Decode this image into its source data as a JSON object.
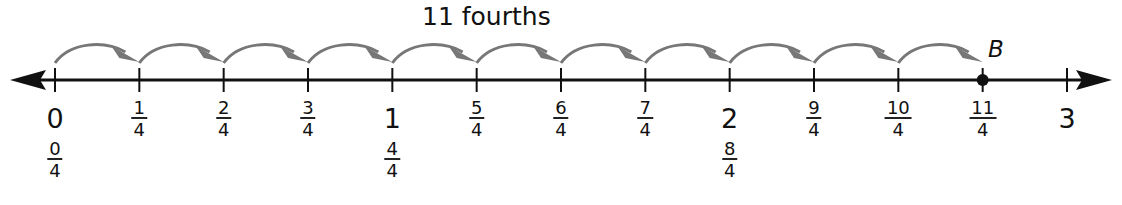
{
  "title": "11 fourths",
  "point": {
    "name": "B",
    "value": "11/4",
    "position": 2.75
  },
  "arrow_color": "#777777",
  "line_color": "#111111",
  "jumps": 11,
  "ticks": [
    {
      "pos": 0,
      "whole": "0",
      "frac": {
        "num": "0",
        "den": "4"
      }
    },
    {
      "pos": 0.25,
      "frac": {
        "num": "1",
        "den": "4"
      }
    },
    {
      "pos": 0.5,
      "frac": {
        "num": "2",
        "den": "4"
      }
    },
    {
      "pos": 0.75,
      "frac": {
        "num": "3",
        "den": "4"
      }
    },
    {
      "pos": 1,
      "whole": "1",
      "frac": {
        "num": "4",
        "den": "4"
      }
    },
    {
      "pos": 1.25,
      "frac": {
        "num": "5",
        "den": "4"
      }
    },
    {
      "pos": 1.5,
      "frac": {
        "num": "6",
        "den": "4"
      }
    },
    {
      "pos": 1.75,
      "frac": {
        "num": "7",
        "den": "4"
      }
    },
    {
      "pos": 2,
      "whole": "2",
      "frac": {
        "num": "8",
        "den": "4"
      }
    },
    {
      "pos": 2.25,
      "frac": {
        "num": "9",
        "den": "4"
      }
    },
    {
      "pos": 2.5,
      "frac": {
        "num": "10",
        "den": "4"
      }
    },
    {
      "pos": 2.75,
      "frac": {
        "num": "11",
        "den": "4"
      }
    },
    {
      "pos": 3,
      "whole": "3"
    }
  ]
}
